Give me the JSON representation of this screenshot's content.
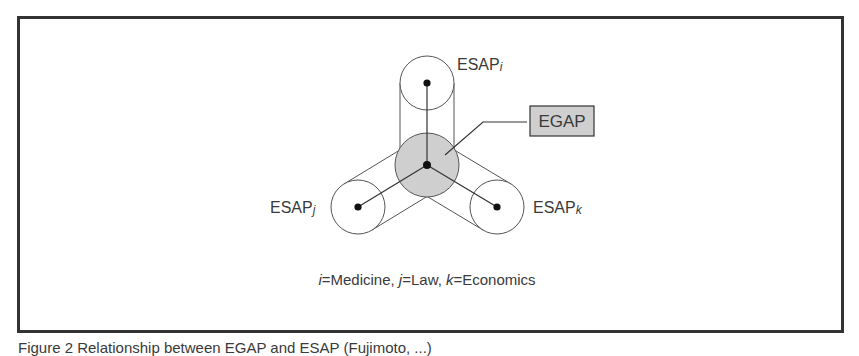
{
  "diagram": {
    "center_node": {
      "label": "EGAP",
      "fill": "#cfcfcf"
    },
    "nodes": [
      {
        "id": "i",
        "label_base": "ESAP",
        "label_sub": "i"
      },
      {
        "id": "j",
        "label_base": "ESAP",
        "label_sub": "j"
      },
      {
        "id": "k",
        "label_base": "ESAP",
        "label_sub": "k"
      }
    ],
    "legend": {
      "parts": [
        {
          "var": "i",
          "text": "=Medicine, "
        },
        {
          "var": "j",
          "text": "=Law, "
        },
        {
          "var": "k",
          "text": "=Economics"
        }
      ]
    },
    "caption_partial": "Figure 2 Relationship between EGAP and ESAP (Fujimoto, ...)"
  },
  "colors": {
    "frame": "#333333",
    "stroke": "#555555",
    "center_fill": "#cfcfcf",
    "dot": "#111111",
    "text": "#3a3a3a"
  }
}
